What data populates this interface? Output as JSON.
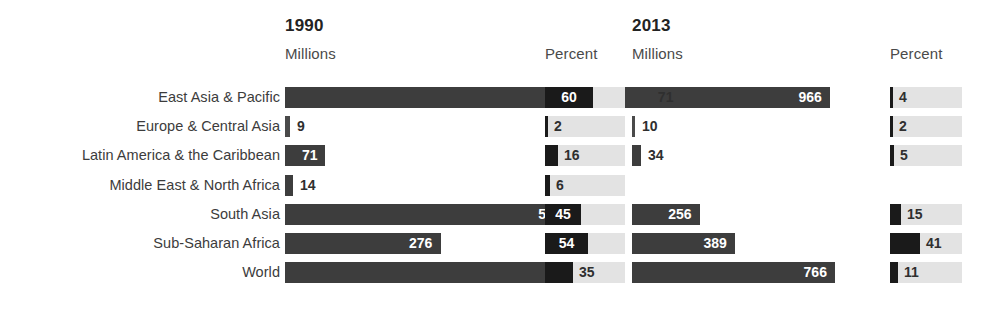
{
  "headers": {
    "y1990": {
      "year": "1990",
      "units": "Millions",
      "percent": "Percent"
    },
    "y2013": {
      "year": "2013",
      "units": "Millions",
      "percent": "Percent"
    }
  },
  "chart_data": {
    "type": "bar",
    "title": "",
    "xlabel": "",
    "ylabel": "",
    "categories": [
      "East Asia & Pacific",
      "Europe & Central Asia",
      "Latin America & the Caribbean",
      "Middle East & North Africa",
      "South Asia",
      "Sub-Saharan Africa",
      "World"
    ],
    "series": [
      {
        "name": "1990 Millions",
        "units": "millions",
        "values": [
          966,
          9,
          71,
          14,
          505,
          276,
          1841
        ],
        "labels": [
          "966",
          "9",
          "71",
          "14",
          "505",
          "276",
          "1,841"
        ]
      },
      {
        "name": "1990 Percent",
        "units": "percent",
        "values": [
          60,
          2,
          16,
          6,
          45,
          54,
          35
        ],
        "labels": [
          "60",
          "2",
          "16",
          "6",
          "45",
          "54",
          "35"
        ]
      },
      {
        "name": "2013 Millions",
        "units": "millions",
        "values": [
          71,
          10,
          34,
          null,
          256,
          389,
          766
        ],
        "labels": [
          "71",
          "10",
          "34",
          "",
          "256",
          "389",
          "766"
        ]
      },
      {
        "name": "2013 Percent",
        "units": "percent",
        "values": [
          4,
          2,
          5,
          null,
          15,
          41,
          11
        ],
        "labels": [
          "4",
          "2",
          "5",
          "",
          "15",
          "41",
          "11"
        ]
      }
    ],
    "notes": [
      "1990 World millions bar is drawn with an axis-break (zigzag) mark"
    ],
    "grid": false,
    "legend": "none"
  },
  "colors": {
    "bar": "#3d3d3d",
    "percent_fill": "#1a1a1a",
    "percent_track": "#e3e3e3",
    "text": "#3a3a3a",
    "background": "#ffffff"
  }
}
